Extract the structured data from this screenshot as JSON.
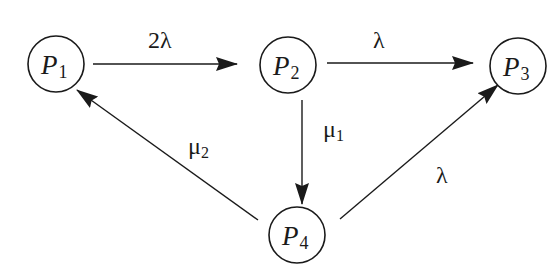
{
  "diagram": {
    "type": "state-transition",
    "nodes": [
      {
        "id": "P1",
        "base": "P",
        "sub": "1",
        "cx": 56,
        "cy": 64
      },
      {
        "id": "P2",
        "base": "P",
        "sub": "2",
        "cx": 288,
        "cy": 65
      },
      {
        "id": "P3",
        "base": "P",
        "sub": "3",
        "cx": 518,
        "cy": 66
      },
      {
        "id": "P4",
        "base": "P",
        "sub": "4",
        "cx": 297,
        "cy": 235
      }
    ],
    "edges": [
      {
        "from": "P1",
        "to": "P2",
        "label": "2λ",
        "label_sub": ""
      },
      {
        "from": "P2",
        "to": "P3",
        "label": "λ",
        "label_sub": ""
      },
      {
        "from": "P2",
        "to": "P4",
        "label": "μ",
        "label_sub": "1"
      },
      {
        "from": "P4",
        "to": "P1",
        "label": "μ",
        "label_sub": "2"
      },
      {
        "from": "P4",
        "to": "P3",
        "label": "λ",
        "label_sub": ""
      }
    ],
    "colors": {
      "stroke": "#1a1a1a",
      "background": "#ffffff"
    }
  }
}
